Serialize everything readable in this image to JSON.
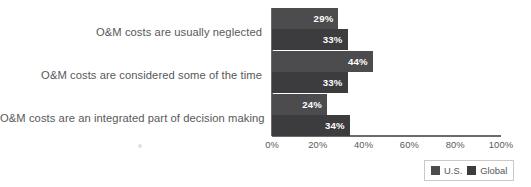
{
  "chart_data": {
    "type": "bar",
    "orientation": "horizontal",
    "title": "",
    "subtitle": "",
    "xlabel": "",
    "ylabel": "",
    "xlim": [
      0,
      100
    ],
    "grid": false,
    "legend_position": "bottom-right",
    "categories": [
      "O&M costs are usually neglected",
      "O&M costs are considered some of the time",
      "O&M costs are an integrated part of decision making"
    ],
    "series": [
      {
        "name": "U.S.",
        "color": "#4c4c4e",
        "values": [
          29,
          44,
          24
        ],
        "labels": [
          "29%",
          "44%",
          "24%"
        ]
      },
      {
        "name": "Global",
        "color": "#3c3c3e",
        "values": [
          33,
          33,
          34
        ],
        "labels": [
          "33%",
          "33%",
          "34%"
        ]
      }
    ],
    "xticks": [
      0,
      20,
      40,
      60,
      80,
      100
    ],
    "xtick_labels": [
      "0%",
      "20%",
      "40%",
      "60%",
      "80%",
      "100%"
    ],
    "value_label_color": "#ffffff",
    "axis_color": "#6b6b6b",
    "text_color": "#58585a",
    "background": "#ffffff"
  }
}
